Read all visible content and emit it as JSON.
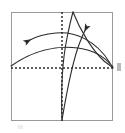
{
  "figure": {
    "background_color": "#ffffff",
    "frame": {
      "name": "plot-frame",
      "x": 11,
      "y": 12,
      "width": 102,
      "height": 109,
      "stroke_color": "#9a9a9a",
      "stroke_width": 1,
      "fill": "none"
    },
    "axes": {
      "style": "dashed",
      "dash_pattern": "2,2",
      "stroke_color": "#2b2b2b",
      "stroke_width": 1.4,
      "vertical": {
        "name": "vertical-dashed-axis",
        "x": 62,
        "y1": 12,
        "y2": 121
      },
      "horizontal": {
        "name": "horizontal-dashed-axis",
        "y": 68,
        "x1": 11,
        "x2": 113
      },
      "origin": {
        "x": 62,
        "y": 68
      }
    },
    "curves": [
      {
        "name": "upper-left-arrow-curve",
        "description": "Arc sweeping from lower right up over the origin and out to the left, ending in an arrowhead pointing left",
        "stroke_color": "#2b2b2b",
        "stroke_width": 1.1,
        "path": "M 110 63 C 96 40, 74 31, 56 33 C 44 34, 36 36, 29 40",
        "arrow": {
          "name": "left-arrowhead",
          "x": 27,
          "y": 41,
          "angle_deg": 200,
          "length": 9,
          "width": 6,
          "color": "#2b2b2b"
        }
      },
      {
        "name": "lower-left-rising-curve",
        "description": "Shallow arc rising from the left frame edge across the origin toward the right frame edge",
        "stroke_color": "#2b2b2b",
        "stroke_width": 1.1,
        "path": "M 11 66 C 32 51, 56 45, 78 48 C 94 50, 105 57, 113 67",
        "arrow": null
      },
      {
        "name": "bottom-to-upper-right-arrow-curve",
        "description": "Steep curve rising from bottom center, bending right and ending in an arrowhead pointing up-right",
        "stroke_color": "#2b2b2b",
        "stroke_width": 1.1,
        "path": "M 62 120 C 66 96, 72 62, 80 42 C 82 37, 84 33, 86 30",
        "arrow": {
          "name": "upper-right-arrowhead",
          "x": 88,
          "y": 25,
          "angle_deg": 300,
          "length": 9,
          "width": 6,
          "color": "#2b2b2b"
        }
      },
      {
        "name": "bottom-to-top-curve",
        "description": "Steep curve rising from bottom center, bowing left then reaching the top frame edge right of the vertical axis",
        "stroke_color": "#2b2b2b",
        "stroke_width": 1.1,
        "path": "M 62 120 C 61 92, 62 62, 67 38 C 69 28, 71 19, 73 12",
        "arrow": null
      },
      {
        "name": "top-right-descending-curve",
        "description": "Curve from the top frame edge descending to the right frame edge at the horizontal axis",
        "stroke_color": "#2b2b2b",
        "stroke_width": 1.1,
        "path": "M 73 12 C 80 30, 92 50, 104 61 C 108 64, 111 66, 113 68",
        "arrow": null
      }
    ],
    "marks": [
      {
        "name": "right-edge-tick",
        "description": "Small gray tick outside the right frame edge at axis height",
        "color": "#b9b9b9"
      },
      {
        "name": "below-frame-mark",
        "description": "Faint mark below the bottom-left of the frame",
        "color": "#ededed"
      }
    ]
  }
}
